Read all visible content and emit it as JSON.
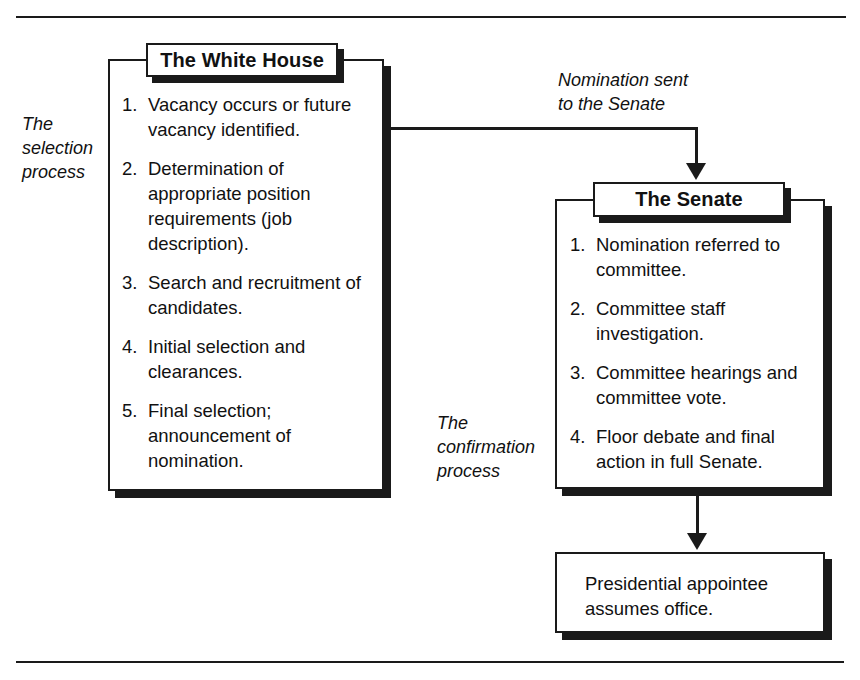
{
  "figure": {
    "kind": "flow-diagram",
    "ink_color": "#1a1a1a",
    "background_color": "#ffffff"
  },
  "captions": {
    "selection_process": "The\nselection\nprocess",
    "selection_process_lines": [
      "The",
      "selection",
      "process"
    ],
    "confirmation_process_lines": [
      "The",
      "confirmation",
      "process"
    ],
    "nomination_sent_lines": [
      "Nomination sent",
      "to the Senate"
    ]
  },
  "white_house": {
    "title": "The White House",
    "steps": [
      {
        "num": "1.",
        "text": "Vacancy occurs or future vacancy identified."
      },
      {
        "num": "2.",
        "text": "Determination of appropriate position requirements (job description)."
      },
      {
        "num": "3.",
        "text": "Search and recruitment of candidates."
      },
      {
        "num": "4.",
        "text": "Initial selection and clearances."
      },
      {
        "num": "5.",
        "text": "Final selection; announcement of nomination."
      }
    ]
  },
  "senate": {
    "title": "The Senate",
    "steps": [
      {
        "num": "1.",
        "text": "Nomination referred to committee."
      },
      {
        "num": "2.",
        "text": "Committee staff investigation."
      },
      {
        "num": "3.",
        "text": "Committee hearings and committee vote."
      },
      {
        "num": "4.",
        "text": "Floor debate and final action in full Senate."
      }
    ]
  },
  "outcome": {
    "text": "Presidential appointee assumes office."
  }
}
